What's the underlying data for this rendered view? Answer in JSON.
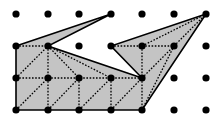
{
  "diagram": {
    "type": "lattice-polygon-triangulation",
    "grid": {
      "columns": 7,
      "rows": 4,
      "x_positions": [
        16,
        48,
        79,
        111,
        142,
        174,
        206
      ],
      "y_positions": [
        14,
        46,
        78,
        110
      ],
      "dot_radius": 3.6,
      "dot_color": "#000000"
    },
    "polygon": {
      "fill": "#c4c4c4",
      "stroke": "#000000",
      "vertices": [
        [
          0,
          1
        ],
        [
          3,
          0
        ],
        [
          1,
          1
        ],
        [
          4,
          2
        ],
        [
          3,
          1
        ],
        [
          6,
          0
        ],
        [
          4,
          3
        ],
        [
          0,
          3
        ]
      ]
    },
    "triangulation": {
      "stroke": "#000000",
      "dash": "1.6 1.6",
      "edges": [
        [
          [
            0,
            1
          ],
          [
            1,
            1
          ]
        ],
        [
          [
            0,
            2
          ],
          [
            4,
            2
          ]
        ],
        [
          [
            0,
            3
          ],
          [
            1,
            2
          ]
        ],
        [
          [
            1,
            3
          ],
          [
            2,
            2
          ]
        ],
        [
          [
            2,
            3
          ],
          [
            3,
            2
          ]
        ],
        [
          [
            3,
            3
          ],
          [
            4,
            2
          ]
        ],
        [
          [
            1,
            1
          ],
          [
            1,
            3
          ]
        ],
        [
          [
            2,
            2
          ],
          [
            2,
            3
          ]
        ],
        [
          [
            3,
            2
          ],
          [
            3,
            3
          ]
        ],
        [
          [
            4,
            2
          ],
          [
            4,
            3
          ]
        ],
        [
          [
            0,
            2
          ],
          [
            1,
            1
          ]
        ],
        [
          [
            1,
            1
          ],
          [
            2,
            2
          ]
        ],
        [
          [
            1,
            1
          ],
          [
            3,
            2
          ]
        ],
        [
          [
            3,
            1
          ],
          [
            4,
            1
          ]
        ],
        [
          [
            4,
            1
          ],
          [
            5,
            1
          ]
        ],
        [
          [
            4,
            1
          ],
          [
            6,
            0
          ]
        ],
        [
          [
            5,
            1
          ],
          [
            6,
            0
          ]
        ],
        [
          [
            4,
            1
          ],
          [
            4,
            2
          ]
        ],
        [
          [
            4,
            2
          ],
          [
            5,
            1
          ]
        ],
        [
          [
            4,
            3
          ],
          [
            5,
            1
          ]
        ]
      ]
    }
  }
}
